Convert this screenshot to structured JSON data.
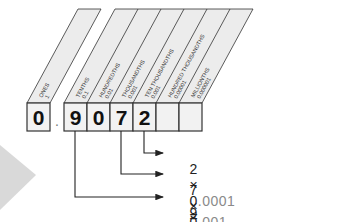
{
  "diagram": {
    "number": "0.9072",
    "decimal_point": ".",
    "columns": [
      {
        "name": "ONES",
        "value": "1",
        "digit": "0"
      },
      {
        "name": "TENTHS",
        "value": "0.1",
        "digit": "9"
      },
      {
        "name": "HUNDREDTHS",
        "value": "0.01",
        "digit": "0"
      },
      {
        "name": "THOUSANDTHS",
        "value": "0.001",
        "digit": "7"
      },
      {
        "name": "TEN THOUSANDTHS",
        "value": "0.001",
        "digit": "2"
      },
      {
        "name": "HUNDRED THOUSANDTHS",
        "value": "0.00001",
        "digit": ""
      },
      {
        "name": "MILLIONTHS",
        "value": "0.000001",
        "digit": ""
      }
    ],
    "equations": [
      {
        "digit": "2",
        "times": "×",
        "mult_lead": "0",
        "mult_rest": ".0001",
        "equals": "=",
        "result": "0.0002"
      },
      {
        "digit": "7",
        "times": "×",
        "mult_lead": "0",
        "mult_rest": ".001",
        "equals": "=",
        "result": "0.007"
      },
      {
        "digit": "9",
        "times": "×",
        "mult_lead": "0",
        "mult_rest": ".1",
        "equals": "=",
        "result": "0.9"
      }
    ],
    "colors": {
      "header_fill": "#ececec",
      "box_fill": "#f2f2f2",
      "stroke": "#333333",
      "arrow": "#222222",
      "triangle": "#d9d9d9",
      "faint_text": "#8a8a8a"
    }
  }
}
